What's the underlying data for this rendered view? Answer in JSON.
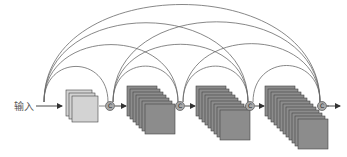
{
  "diagram": {
    "type": "densenet-dense-block",
    "input_label": "输入",
    "concat_symbol": "C",
    "colors": {
      "line": "#6a6a6a",
      "light_map_fill": "#d3d3d3",
      "dark_map_fill": "#8c8c8c",
      "map_stroke": "#444444",
      "concat_fill": "#a8a8a8"
    },
    "nodes": [
      {
        "id": "input",
        "x": 44
      },
      {
        "id": "c1",
        "x": 110
      },
      {
        "id": "c2",
        "x": 180
      },
      {
        "id": "c3",
        "x": 250
      },
      {
        "id": "c4",
        "x": 322
      }
    ],
    "stacks": [
      {
        "id": "stack-1",
        "count": 3,
        "x": 66,
        "tone": "light"
      },
      {
        "id": "stack-2",
        "count": 7,
        "x": 127,
        "tone": "dark"
      },
      {
        "id": "stack-3",
        "count": 9,
        "x": 196,
        "tone": "dark"
      },
      {
        "id": "stack-4",
        "count": 12,
        "x": 265,
        "tone": "dark"
      }
    ],
    "connections": "every node connects via arcs to every later concatenation node"
  }
}
